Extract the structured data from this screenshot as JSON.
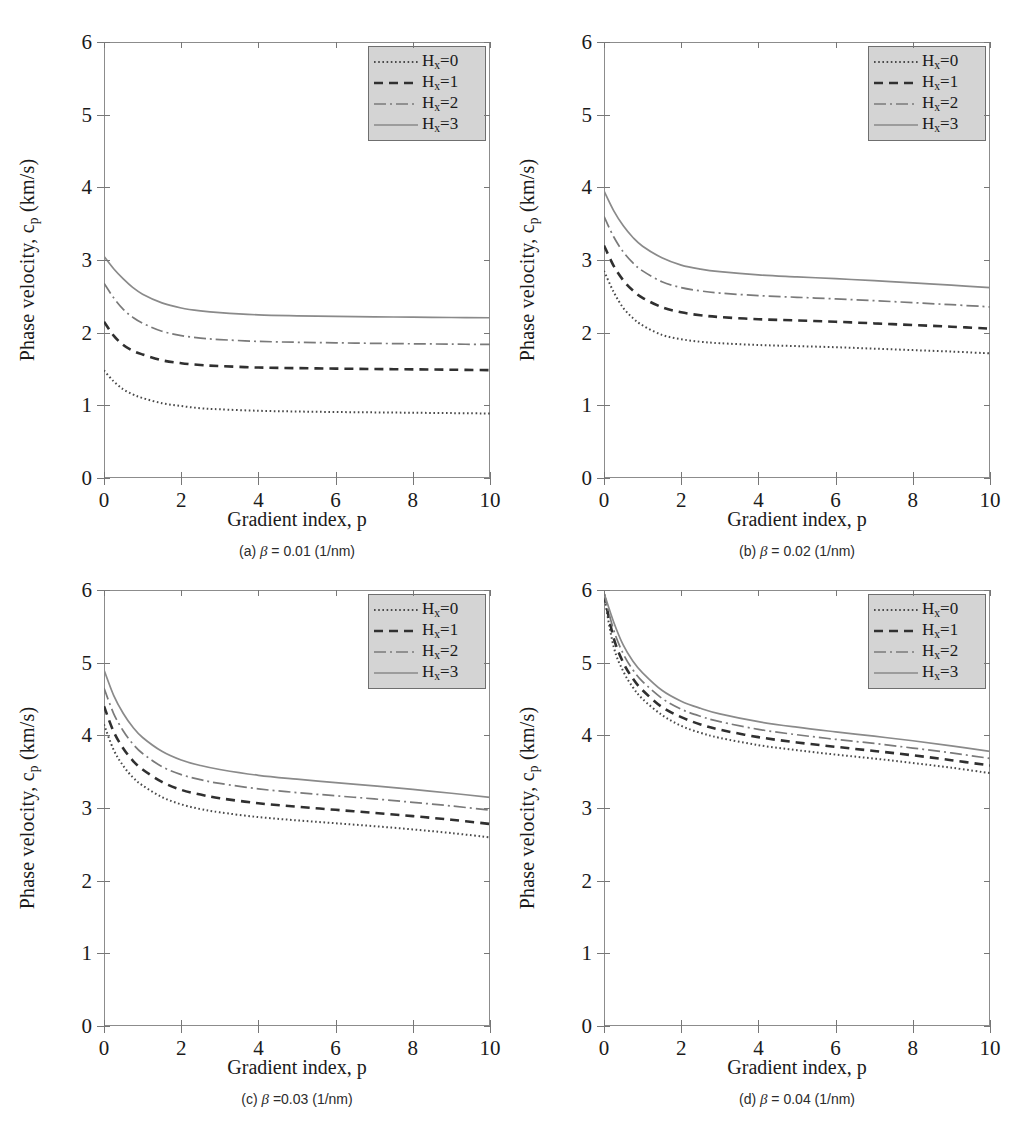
{
  "figure": {
    "axis": {
      "xlabel": "Gradient index, p",
      "ylabel_pre": "Phase velocity, c",
      "ylabel_sub": "p",
      "ylabel_post": " (km/s)",
      "xticks": [
        "0",
        "2",
        "4",
        "6",
        "8",
        "10"
      ],
      "yticks": [
        "0",
        "1",
        "2",
        "3",
        "4",
        "5",
        "6"
      ],
      "xlim": [
        0,
        10
      ],
      "ylim": [
        0,
        6
      ]
    },
    "legend": {
      "entries": [
        {
          "label_pre": "H",
          "label_sub": "x",
          "label_post": "=0",
          "style": "dotted"
        },
        {
          "label_pre": "H",
          "label_sub": "x",
          "label_post": "=1",
          "style": "dashed"
        },
        {
          "label_pre": "H",
          "label_sub": "x",
          "label_post": "=2",
          "style": "dashdot"
        },
        {
          "label_pre": "H",
          "label_sub": "x",
          "label_post": "=3",
          "style": "solid"
        }
      ],
      "background": "#d4d4d4",
      "border": "#6f6f6f"
    },
    "panels": [
      {
        "id": "a",
        "caption": "(a) β = 0.01 (1/nm)"
      },
      {
        "id": "b",
        "caption": "(b) β = 0.02 (1/nm)"
      },
      {
        "id": "c",
        "caption": "(c) β =0.03 (1/nm)"
      },
      {
        "id": "d",
        "caption": "(d) β = 0.04 (1/nm)"
      }
    ]
  },
  "chart_data": [
    {
      "type": "line",
      "panel": "a",
      "title": "(a) β = 0.01 (1/nm)",
      "xlabel": "Gradient index, p",
      "ylabel": "Phase velocity, c_p (km/s)",
      "xlim": [
        0,
        10
      ],
      "ylim": [
        0,
        6
      ],
      "grid": false,
      "legend_position": "top-right",
      "x": [
        0,
        0.25,
        0.5,
        0.75,
        1,
        1.5,
        2,
        2.5,
        3,
        4,
        5,
        6,
        7,
        8,
        9,
        10
      ],
      "series": [
        {
          "name": "Hx=0",
          "style": "dotted",
          "values": [
            1.48,
            1.33,
            1.22,
            1.15,
            1.1,
            1.03,
            0.99,
            0.96,
            0.945,
            0.925,
            0.915,
            0.908,
            0.903,
            0.898,
            0.893,
            0.888
          ]
        },
        {
          "name": "Hx=1",
          "style": "dashed",
          "values": [
            2.15,
            1.96,
            1.83,
            1.75,
            1.7,
            1.62,
            1.58,
            1.555,
            1.54,
            1.52,
            1.512,
            1.505,
            1.5,
            1.495,
            1.49,
            1.485
          ]
        },
        {
          "name": "Hx=2",
          "style": "dashdot",
          "values": [
            2.68,
            2.48,
            2.32,
            2.21,
            2.13,
            2.02,
            1.96,
            1.925,
            1.905,
            1.88,
            1.868,
            1.86,
            1.853,
            1.847,
            1.842,
            1.838
          ]
        },
        {
          "name": "Hx=3",
          "style": "solid",
          "values": [
            3.05,
            2.88,
            2.74,
            2.62,
            2.53,
            2.41,
            2.34,
            2.3,
            2.275,
            2.245,
            2.232,
            2.224,
            2.218,
            2.213,
            2.209,
            2.205
          ]
        }
      ]
    },
    {
      "type": "line",
      "panel": "b",
      "title": "(b) β = 0.02 (1/nm)",
      "xlabel": "Gradient index, p",
      "ylabel": "Phase velocity, c_p (km/s)",
      "xlim": [
        0,
        10
      ],
      "ylim": [
        0,
        6
      ],
      "grid": false,
      "legend_position": "top-right",
      "x": [
        0,
        0.25,
        0.5,
        0.75,
        1,
        1.5,
        2,
        2.5,
        3,
        4,
        5,
        6,
        7,
        8,
        9,
        10
      ],
      "series": [
        {
          "name": "Hx=0",
          "style": "dotted",
          "values": [
            2.85,
            2.56,
            2.34,
            2.2,
            2.1,
            1.97,
            1.91,
            1.875,
            1.855,
            1.83,
            1.815,
            1.8,
            1.78,
            1.76,
            1.74,
            1.715
          ]
        },
        {
          "name": "Hx=1",
          "style": "dashed",
          "values": [
            3.2,
            2.92,
            2.72,
            2.58,
            2.48,
            2.35,
            2.28,
            2.24,
            2.215,
            2.185,
            2.168,
            2.15,
            2.128,
            2.105,
            2.082,
            2.055
          ]
        },
        {
          "name": "Hx=2",
          "style": "dashdot",
          "values": [
            3.6,
            3.32,
            3.11,
            2.96,
            2.85,
            2.7,
            2.62,
            2.575,
            2.545,
            2.51,
            2.487,
            2.465,
            2.44,
            2.413,
            2.385,
            2.355
          ]
        },
        {
          "name": "Hx=3",
          "style": "solid",
          "values": [
            3.95,
            3.68,
            3.47,
            3.31,
            3.19,
            3.03,
            2.93,
            2.875,
            2.84,
            2.795,
            2.768,
            2.743,
            2.715,
            2.685,
            2.653,
            2.62
          ]
        }
      ]
    },
    {
      "type": "line",
      "panel": "c",
      "title": "(c) β =0.03 (1/nm)",
      "xlabel": "Gradient index, p",
      "ylabel": "Phase velocity, c_p (km/s)",
      "xlim": [
        0,
        10
      ],
      "ylim": [
        0,
        6
      ],
      "grid": false,
      "legend_position": "top-right",
      "x": [
        0,
        0.25,
        0.5,
        0.75,
        1,
        1.5,
        2,
        2.5,
        3,
        4,
        5,
        6,
        7,
        8,
        9,
        10
      ],
      "series": [
        {
          "name": "Hx=0",
          "style": "dotted",
          "values": [
            4.15,
            3.8,
            3.58,
            3.42,
            3.31,
            3.15,
            3.05,
            2.985,
            2.94,
            2.875,
            2.83,
            2.79,
            2.75,
            2.705,
            2.655,
            2.595
          ]
        },
        {
          "name": "Hx=1",
          "style": "dashed",
          "values": [
            4.4,
            4.05,
            3.82,
            3.65,
            3.53,
            3.36,
            3.25,
            3.185,
            3.135,
            3.065,
            3.018,
            2.975,
            2.933,
            2.888,
            2.838,
            2.78
          ]
        },
        {
          "name": "Hx=2",
          "style": "dashdot",
          "values": [
            4.65,
            4.3,
            4.06,
            3.88,
            3.75,
            3.57,
            3.46,
            3.39,
            3.338,
            3.263,
            3.212,
            3.168,
            3.125,
            3.078,
            3.028,
            2.97
          ]
        },
        {
          "name": "Hx=3",
          "style": "solid",
          "values": [
            4.9,
            4.55,
            4.3,
            4.11,
            3.97,
            3.78,
            3.66,
            3.585,
            3.53,
            3.45,
            3.397,
            3.35,
            3.305,
            3.255,
            3.203,
            3.145
          ]
        }
      ]
    },
    {
      "type": "line",
      "panel": "d",
      "title": "(d) β = 0.04 (1/nm)",
      "xlabel": "Gradient index, p",
      "ylabel": "Phase velocity, c_p (km/s)",
      "xlim": [
        0,
        10
      ],
      "ylim": [
        0,
        6
      ],
      "grid": false,
      "legend_position": "top-right",
      "x": [
        0,
        0.25,
        0.5,
        0.75,
        1,
        1.5,
        2,
        2.5,
        3,
        4,
        5,
        6,
        7,
        8,
        9,
        10
      ],
      "series": [
        {
          "name": "Hx=0",
          "style": "dotted",
          "values": [
            5.92,
            5.22,
            4.88,
            4.66,
            4.5,
            4.28,
            4.13,
            4.035,
            3.965,
            3.865,
            3.795,
            3.735,
            3.68,
            3.62,
            3.555,
            3.48
          ]
        },
        {
          "name": "Hx=1",
          "style": "dashed",
          "values": [
            5.94,
            5.34,
            5.0,
            4.78,
            4.62,
            4.39,
            4.25,
            4.15,
            4.078,
            3.975,
            3.902,
            3.842,
            3.785,
            3.725,
            3.658,
            3.585
          ]
        },
        {
          "name": "Hx=2",
          "style": "dashdot",
          "values": [
            5.95,
            5.45,
            5.12,
            4.9,
            4.74,
            4.51,
            4.36,
            4.262,
            4.188,
            4.082,
            4.008,
            3.945,
            3.888,
            3.825,
            3.758,
            3.682
          ]
        },
        {
          "name": "Hx=3",
          "style": "solid",
          "values": [
            5.96,
            5.56,
            5.24,
            5.02,
            4.86,
            4.62,
            4.47,
            4.372,
            4.295,
            4.188,
            4.112,
            4.048,
            3.988,
            3.925,
            3.855,
            3.778
          ]
        }
      ]
    }
  ]
}
